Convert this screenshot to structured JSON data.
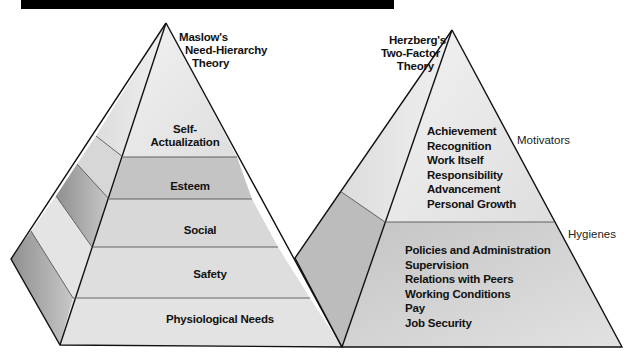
{
  "maslow": {
    "title_lines": [
      "Maslow's",
      "Need-Hierarchy",
      "Theory"
    ],
    "levels": [
      {
        "label": "Self-Actualization",
        "lines": [
          "Self-",
          "Actualization"
        ]
      },
      {
        "label": "Esteem"
      },
      {
        "label": "Social"
      },
      {
        "label": "Safety"
      },
      {
        "label": "Physiological Needs"
      }
    ]
  },
  "herzberg": {
    "title_lines": [
      "Herzberg's",
      "Two-Factor",
      "Theory"
    ],
    "motivators": {
      "label": "Motivators",
      "items": [
        "Achievement",
        "Recognition",
        "Work Itself",
        "Responsibility",
        "Advancement",
        "Personal Growth"
      ]
    },
    "hygienes": {
      "label": "Hygienes",
      "items": [
        "Policies and Administration",
        "Supervision",
        "Relations with Peers",
        "Working Conditions",
        "Pay",
        "Job Security"
      ]
    }
  },
  "colors": {
    "light_face": "#ececec",
    "mid_face": "#c9c9c9",
    "dark_face": "#a9a9a9",
    "outline": "#111111"
  }
}
